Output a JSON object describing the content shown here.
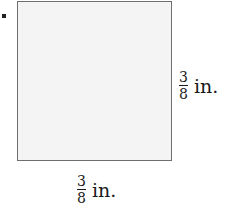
{
  "figure": {
    "shape": "square",
    "bullet": "•",
    "fill_color": "#f4f4f4",
    "border_color": "#6e6e6e",
    "side_labels": {
      "right": {
        "numerator": "3",
        "denominator": "8",
        "unit": "in."
      },
      "bottom": {
        "numerator": "3",
        "denominator": "8",
        "unit": "in."
      }
    }
  }
}
